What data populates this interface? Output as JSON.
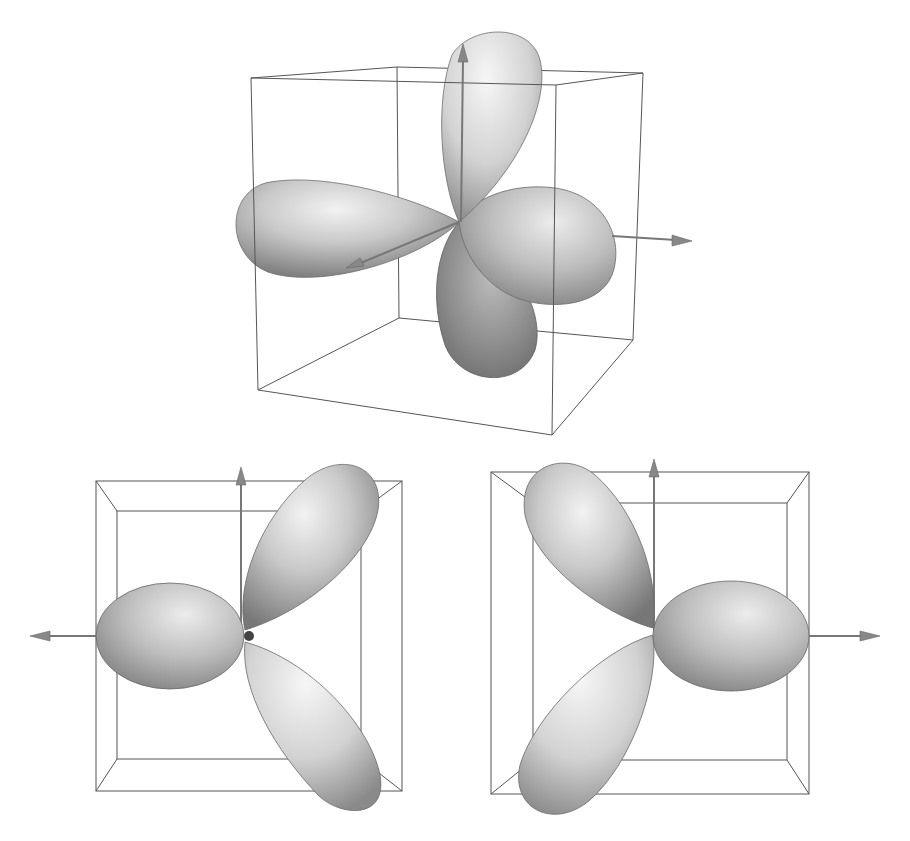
{
  "figure": {
    "panels": [
      {
        "id": "top",
        "view": "perspective",
        "lobe_count": 4
      },
      {
        "id": "bottom-left",
        "view": "front",
        "lobe_count": 3,
        "axis_arrows": [
          "up",
          "left"
        ]
      },
      {
        "id": "bottom-right",
        "view": "front",
        "lobe_count": 3,
        "axis_arrows": [
          "up",
          "right"
        ]
      }
    ],
    "colors": {
      "background": "#ffffff",
      "lobe_light": "#e6e6e6",
      "lobe_mid": "#b0b0b0",
      "lobe_dark": "#7a7a7a",
      "box_lines": "#555555",
      "axis": "#777777"
    }
  }
}
